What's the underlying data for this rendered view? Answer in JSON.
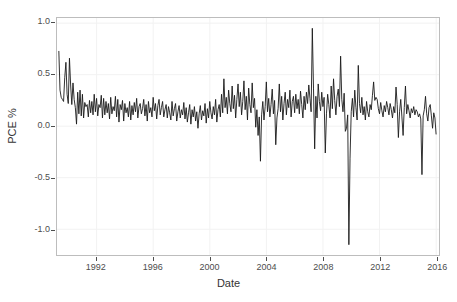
{
  "chart_data": {
    "type": "line",
    "title": "",
    "xlabel": "Date",
    "ylabel": "PCE %",
    "xlim": [
      1989.2,
      2016.2
    ],
    "ylim": [
      -1.25,
      1.05
    ],
    "grid": true,
    "legend": null,
    "line_color": "#1a1a1a",
    "panel_border_color": "#bdbdbd",
    "grid_color": "#f2f2f2",
    "background": "#ffffff",
    "x_ticks": [
      1992,
      1996,
      2000,
      2004,
      2008,
      2012,
      2016
    ],
    "x_tick_labels": [
      "1992",
      "1996",
      "2000",
      "2004",
      "2008",
      "2012",
      "2016"
    ],
    "y_ticks": [
      -1.0,
      -0.5,
      0.0,
      0.5,
      1.0
    ],
    "y_tick_labels": [
      "-1.0",
      "-0.5",
      "0.0",
      "0.5",
      "1.0"
    ],
    "x_start": 1989.33,
    "x_step": 0.08333,
    "series_name": "PCE %",
    "values": [
      0.73,
      0.35,
      0.28,
      0.26,
      0.24,
      0.47,
      0.62,
      0.31,
      0.22,
      0.66,
      0.4,
      0.21,
      0.42,
      0.26,
      0.18,
      0.02,
      0.33,
      0.12,
      0.35,
      0.1,
      0.31,
      0.08,
      0.23,
      0.19,
      0.21,
      0.09,
      0.25,
      0.13,
      0.24,
      0.11,
      0.31,
      0.14,
      0.27,
      0.1,
      0.21,
      0.18,
      0.3,
      0.08,
      0.27,
      0.11,
      0.24,
      0.13,
      0.22,
      0.07,
      0.28,
      0.12,
      0.19,
      0.15,
      0.29,
      0.09,
      0.26,
      0.04,
      0.21,
      0.16,
      0.25,
      0.05,
      0.22,
      0.13,
      0.18,
      0.09,
      0.24,
      0.06,
      0.2,
      0.11,
      0.23,
      0.14,
      0.27,
      0.08,
      0.19,
      0.22,
      0.12,
      0.17,
      0.26,
      0.1,
      0.21,
      0.05,
      0.24,
      0.13,
      0.18,
      0.09,
      0.28,
      0.15,
      0.22,
      0.07,
      0.2,
      0.26,
      0.11,
      0.18,
      0.24,
      0.09,
      0.16,
      0.21,
      0.08,
      0.19,
      0.13,
      0.06,
      0.24,
      0.1,
      0.17,
      0.22,
      0.05,
      0.14,
      0.2,
      0.08,
      0.16,
      0.11,
      0.23,
      0.07,
      0.18,
      0.04,
      0.13,
      0.21,
      0.02,
      0.16,
      0.09,
      0.19,
      0.05,
      0.14,
      -0.02,
      0.12,
      0.2,
      0.06,
      0.15,
      0.1,
      0.22,
      0.03,
      0.17,
      0.08,
      0.24,
      0.13,
      0.07,
      0.19,
      0.11,
      0.26,
      0.04,
      0.16,
      0.21,
      0.09,
      0.31,
      0.13,
      0.46,
      0.18,
      0.28,
      0.12,
      0.35,
      0.22,
      0.14,
      0.39,
      0.17,
      0.3,
      0.08,
      0.26,
      0.41,
      0.19,
      0.33,
      0.11,
      0.24,
      0.44,
      0.16,
      0.29,
      0.06,
      0.37,
      0.21,
      0.13,
      0.42,
      0.18,
      0.27,
      -0.01,
      0.16,
      -0.09,
      0.09,
      -0.34,
      0.11,
      0.24,
      0.06,
      0.19,
      0.43,
      0.14,
      0.27,
      0.09,
      0.21,
      0.36,
      0.12,
      0.25,
      -0.18,
      0.08,
      0.17,
      0.41,
      0.14,
      0.29,
      0.06,
      0.22,
      0.33,
      0.11,
      0.26,
      0.18,
      0.35,
      0.09,
      0.24,
      0.29,
      0.13,
      0.31,
      0.17,
      0.26,
      0.12,
      0.34,
      0.21,
      0.08,
      0.29,
      0.16,
      0.33,
      0.22,
      0.4,
      0.27,
      0.14,
      0.95,
      0.37,
      -0.22,
      0.29,
      0.08,
      0.41,
      0.24,
      0.15,
      0.33,
      0.19,
      0.28,
      -0.26,
      0.12,
      0.31,
      0.21,
      0.08,
      0.39,
      0.17,
      0.46,
      0.25,
      0.11,
      0.29,
      0.36,
      0.19,
      0.68,
      0.26,
      0.14,
      0.32,
      -0.05,
      -0.02,
      0.11,
      -1.15,
      -0.31,
      0.14,
      0.27,
      0.09,
      0.35,
      0.18,
      0.06,
      0.59,
      0.22,
      0.13,
      0.28,
      0.11,
      0.19,
      0.06,
      0.24,
      0.14,
      0.09,
      0.21,
      0.16,
      0.3,
      0.43,
      0.25,
      0.28,
      0.26,
      0.17,
      0.12,
      0.23,
      0.15,
      0.09,
      0.2,
      0.14,
      0.24,
      0.18,
      0.11,
      0.22,
      0.16,
      0.08,
      0.19,
      0.13,
      0.38,
      0.21,
      -0.11,
      0.14,
      0.26,
      0.09,
      -0.09,
      0.18,
      0.39,
      0.12,
      0.21,
      0.15,
      0.08,
      0.17,
      0.13,
      0.19,
      0.11,
      0.16,
      0.14,
      0.09,
      0.12,
      0.07,
      -0.47,
      0.1,
      0.16,
      0.29,
      0.12,
      0.05,
      0.18,
      0.21,
      0.1,
      -0.02,
      0.13,
      0.08,
      -0.08
    ]
  }
}
